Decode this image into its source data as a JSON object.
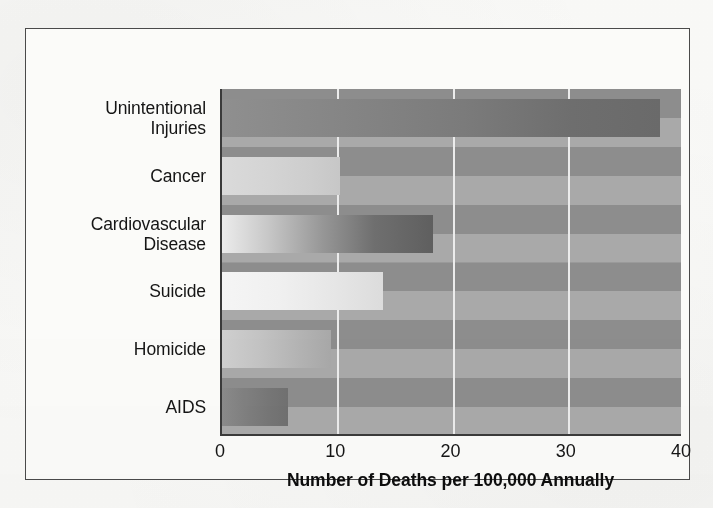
{
  "figure": {
    "frame_color": "#4a4a4a",
    "background_color": "#fbfbf9",
    "plot_background_color": "#9a9a9a",
    "gridline_color": "#ececec",
    "axis_color": "#3a3a3a"
  },
  "chart_data": {
    "type": "bar",
    "orientation": "horizontal",
    "title": "",
    "subtitle": "",
    "xlabel": "Number of Deaths per 100,000 Annually",
    "ylabel": "",
    "categories": [
      "Unintentional\nInjuries",
      "Cancer",
      "Cardiovascular\nDisease",
      "Suicide",
      "Homicide",
      "AIDS"
    ],
    "values": [
      38.0,
      10.2,
      18.3,
      14.0,
      9.5,
      5.7
    ],
    "xlim": [
      0,
      40
    ],
    "ylim_categories": 6,
    "xticks": [
      0,
      10,
      20,
      30,
      40
    ],
    "xticklabels": [
      "0",
      "10",
      "20",
      "30",
      "40"
    ],
    "gridlines_x": [
      10,
      20,
      30
    ],
    "grid": true,
    "grid_axis": "x",
    "legend": false,
    "legend_position": "none",
    "bar_fill_style": "horizontal-greyscale-gradient",
    "series": [
      {
        "name": "Deaths per 100,000 Annually",
        "values": [
          38.0,
          10.2,
          18.3,
          14.0,
          9.5,
          5.7
        ]
      }
    ]
  },
  "axis": {
    "x_title": "Number of Deaths per 100,000 Annually",
    "ticks": [
      {
        "label": "0",
        "value": 0
      },
      {
        "label": "10",
        "value": 10
      },
      {
        "label": "20",
        "value": 20
      },
      {
        "label": "30",
        "value": 30
      },
      {
        "label": "40",
        "value": 40
      }
    ]
  },
  "bars": [
    {
      "label": "Unintentional\nInjuries",
      "value": 38.0
    },
    {
      "label": "Cancer",
      "value": 10.2
    },
    {
      "label": "Cardiovascular\nDisease",
      "value": 18.3
    },
    {
      "label": "Suicide",
      "value": 14.0
    },
    {
      "label": "Homicide",
      "value": 9.5
    },
    {
      "label": "AIDS",
      "value": 5.7
    }
  ]
}
